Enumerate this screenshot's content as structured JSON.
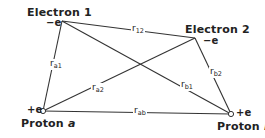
{
  "diagram": {
    "type": "hydrogen-molecule-interparticle-distances",
    "nodes": [
      {
        "id": "electron1",
        "name": "Electron 1",
        "charge": "−e",
        "x": 62,
        "y": 21
      },
      {
        "id": "electron2",
        "name": "Electron 2",
        "charge": "−e",
        "x": 195,
        "y": 38
      },
      {
        "id": "protonA",
        "name": "Proton",
        "name_suffix": "a",
        "charge": "+e",
        "x": 43,
        "y": 111
      },
      {
        "id": "protonB",
        "name": "Proton",
        "name_suffix": "b",
        "charge": "+e",
        "x": 231,
        "y": 114
      }
    ],
    "edges": [
      {
        "from": "electron1",
        "to": "electron2",
        "label": "r",
        "sub": "12"
      },
      {
        "from": "electron1",
        "to": "protonA",
        "label": "r",
        "sub": "a1"
      },
      {
        "from": "electron1",
        "to": "protonB",
        "label": "r",
        "sub": "b1"
      },
      {
        "from": "electron2",
        "to": "protonA",
        "label": "r",
        "sub": "a2"
      },
      {
        "from": "electron2",
        "to": "protonB",
        "label": "r",
        "sub": "b2"
      },
      {
        "from": "protonA",
        "to": "protonB",
        "label": "r",
        "sub": "ab"
      }
    ],
    "line_color": "#333333"
  }
}
